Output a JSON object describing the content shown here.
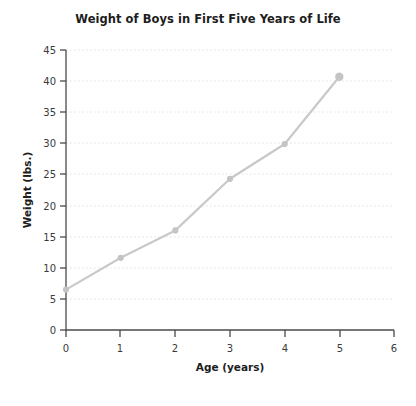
{
  "chart_data": {
    "type": "line",
    "title": "Weight of Boys in First Five Years of Life",
    "xlabel": "Age (years)",
    "ylabel": "Weight (lbs.)",
    "x": [
      0,
      1,
      2,
      3,
      4,
      5
    ],
    "values": [
      6.5,
      11.6,
      16.0,
      24.3,
      29.9,
      40.7
    ],
    "xlim": [
      0,
      6
    ],
    "ylim": [
      0,
      45
    ],
    "xticks": [
      "0",
      "1",
      "2",
      "3",
      "4",
      "5",
      "6"
    ],
    "yticks": [
      "0",
      "5",
      "10",
      "15",
      "20",
      "25",
      "30",
      "35",
      "40",
      "45"
    ],
    "grid": "horizontal-dotted",
    "legend": "none",
    "line_color": "#c9c9c9",
    "marker_color": "#c4c4c4",
    "axis_color": "#4a4a4a",
    "grid_color": "#e2e2e2",
    "background_color": "#ffffff"
  }
}
